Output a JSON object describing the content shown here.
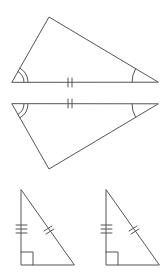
{
  "diagram": {
    "stroke_color": "#555555",
    "background": "#ffffff",
    "figures": [
      {
        "id": "asa-top",
        "type": "triangle",
        "vertices": [
          [
            12,
            82
          ],
          [
            49,
            17
          ],
          [
            158,
            82
          ]
        ],
        "marks": {
          "base_ticks": 2,
          "left_angle_arcs": 2,
          "right_angle_arcs": 1
        }
      },
      {
        "id": "asa-bottom",
        "type": "triangle",
        "vertices": [
          [
            12,
            104
          ],
          [
            49,
            169
          ],
          [
            158,
            104
          ]
        ],
        "marks": {
          "base_ticks": 2,
          "left_angle_arcs": 2,
          "right_angle_arcs": 1
        }
      },
      {
        "id": "hl-left",
        "type": "right-triangle",
        "vertices": [
          [
            21,
            190
          ],
          [
            21,
            265
          ],
          [
            74,
            265
          ]
        ],
        "marks": {
          "leg_ticks": 3,
          "hypotenuse_ticks": 2,
          "right_angle": true
        }
      },
      {
        "id": "hl-right",
        "type": "right-triangle",
        "vertices": [
          [
            106,
            190
          ],
          [
            106,
            265
          ],
          [
            159,
            265
          ]
        ],
        "marks": {
          "leg_ticks": 3,
          "hypotenuse_ticks": 2,
          "right_angle": true
        }
      }
    ]
  }
}
